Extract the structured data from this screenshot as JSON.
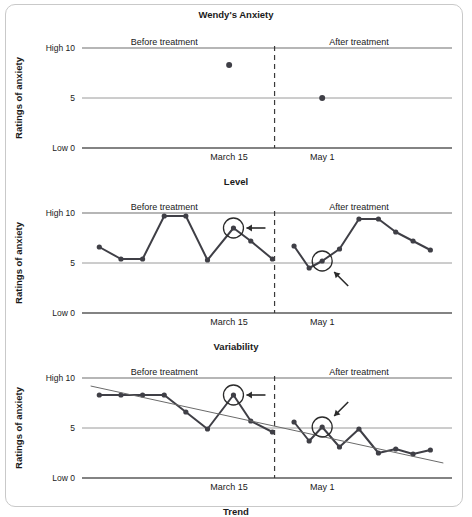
{
  "figure": {
    "title": "Wendy's Anxiety",
    "y_axis_label": "Ratings of anxiety",
    "y_ticks": [
      {
        "value": 10,
        "label": "High 10"
      },
      {
        "value": 5,
        "label": "5"
      },
      {
        "value": 0,
        "label": "Low 0"
      }
    ],
    "phase_labels": {
      "before": "Before treatment",
      "after": "After treatment"
    },
    "date_labels": {
      "before": "March 15",
      "after": "May 1"
    },
    "panel_titles": [
      "Level",
      "Variability",
      "Trend"
    ],
    "colors": {
      "data_line": "#3f3f46",
      "trend_line": "#6a6a6a",
      "gridline": "#6f6f6f",
      "divider": "#3a3a3a",
      "annotation": "#2b2b2b",
      "frame": "#c9c9c9",
      "background": "#ffffff"
    }
  },
  "chart_data": [
    {
      "type": "scatter",
      "title": "Level",
      "xlabel": "Level",
      "ylabel": "Ratings of anxiety",
      "ylim": [
        0,
        10
      ],
      "grid": true,
      "legend": "none",
      "annotations": [
        {
          "text": "Before treatment",
          "x": 4.0,
          "y": 10.6
        },
        {
          "text": "After treatment",
          "x": 13.0,
          "y": 10.6
        },
        {
          "text": "March 15",
          "x": 7.0,
          "y": -0.9
        },
        {
          "text": "May 1",
          "x": 11.3,
          "y": -0.9
        }
      ],
      "divider_x": 9.1,
      "series": [
        {
          "name": "Mean level",
          "x": [
            7.0,
            11.3
          ],
          "values": [
            8.3,
            5.0
          ]
        }
      ]
    },
    {
      "type": "line",
      "title": "Variability",
      "xlabel": "Variability",
      "ylabel": "Ratings of anxiety",
      "ylim": [
        0,
        10
      ],
      "grid": true,
      "legend": "none",
      "divider_x": 9.1,
      "annotations": [
        {
          "text": "Before treatment",
          "x": 4.0,
          "y": 10.6
        },
        {
          "text": "After treatment",
          "x": 13.0,
          "y": 10.6
        },
        {
          "text": "March 15",
          "x": 7.0,
          "y": -0.9
        },
        {
          "text": "May 1",
          "x": 11.3,
          "y": -0.9
        },
        {
          "type": "circle-arrow",
          "x": 7.2,
          "y": 8.5,
          "arrow_from": "right"
        },
        {
          "type": "circle-arrow",
          "x": 11.3,
          "y": 5.2,
          "arrow_from": "lower-right"
        }
      ],
      "series": [
        {
          "name": "Before treatment",
          "x": [
            1.0,
            2.0,
            3.0,
            4.0,
            5.0,
            6.0,
            7.2,
            8.0,
            9.0
          ],
          "values": [
            6.6,
            5.4,
            5.4,
            9.7,
            9.7,
            5.3,
            8.5,
            7.2,
            5.4
          ]
        },
        {
          "name": "After treatment",
          "x": [
            10.0,
            10.7,
            11.3,
            12.1,
            13.0,
            13.9,
            14.7,
            15.5,
            16.3
          ],
          "values": [
            6.7,
            4.5,
            5.2,
            6.4,
            9.4,
            9.4,
            8.1,
            7.2,
            6.3
          ]
        }
      ]
    },
    {
      "type": "line",
      "title": "Trend",
      "xlabel": "Trend",
      "ylabel": "Ratings of anxiety",
      "ylim": [
        0,
        10
      ],
      "grid": true,
      "legend": "none",
      "divider_x": 9.1,
      "annotations": [
        {
          "text": "Before treatment",
          "x": 4.0,
          "y": 10.6
        },
        {
          "text": "After treatment",
          "x": 13.0,
          "y": 10.6
        },
        {
          "text": "March 15",
          "x": 7.0,
          "y": -0.9
        },
        {
          "text": "May 1",
          "x": 11.3,
          "y": -0.9
        },
        {
          "type": "circle-arrow",
          "x": 7.2,
          "y": 8.3,
          "arrow_from": "right"
        },
        {
          "type": "circle-arrow",
          "x": 11.3,
          "y": 5.1,
          "arrow_from": "upper-right"
        }
      ],
      "series": [
        {
          "name": "Before treatment",
          "x": [
            1.0,
            2.0,
            3.0,
            4.0,
            5.0,
            6.0,
            7.2,
            8.0,
            9.0
          ],
          "values": [
            8.3,
            8.3,
            8.3,
            8.3,
            6.6,
            4.9,
            8.3,
            5.7,
            4.6
          ]
        },
        {
          "name": "After treatment",
          "x": [
            10.0,
            10.7,
            11.3,
            12.1,
            13.0,
            13.9,
            14.7,
            15.5,
            16.3
          ],
          "values": [
            5.6,
            3.7,
            5.1,
            3.1,
            4.9,
            2.5,
            2.9,
            2.4,
            2.8
          ]
        },
        {
          "name": "Trend line",
          "type": "trend",
          "x": [
            0.6,
            16.9
          ],
          "values": [
            9.2,
            1.5
          ]
        }
      ]
    }
  ]
}
